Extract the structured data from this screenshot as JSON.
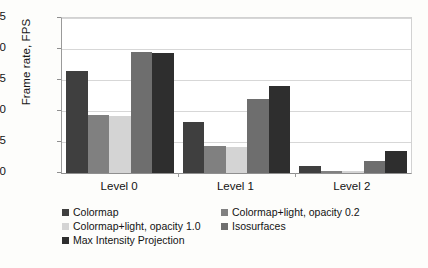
{
  "chart_data": {
    "type": "bar",
    "title": "",
    "xlabel": "",
    "ylabel": "Frame rate, FPS",
    "categories": [
      "Level 0",
      "Level 1",
      "Level 2"
    ],
    "ylim": [
      0,
      25
    ],
    "yticks": [
      0,
      5,
      10,
      15,
      20,
      25
    ],
    "grid": true,
    "legend_position": "bottom",
    "series": [
      {
        "name": "Colormap",
        "color": "#3f3f3f",
        "values": [
          16.5,
          8.3,
          1.2
        ]
      },
      {
        "name": "Colormap+light, opacity 0.2",
        "color": "#808080",
        "values": [
          9.3,
          4.3,
          0.4
        ]
      },
      {
        "name": "Colormap+light, opacity 1.0",
        "color": "#d4d4d4",
        "values": [
          9.2,
          4.2,
          0.3
        ]
      },
      {
        "name": "Isosurfaces",
        "color": "#6e6e6e",
        "values": [
          19.5,
          11.9,
          2.0
        ]
      },
      {
        "name": "Max Intensity Projection",
        "color": "#2e2e2e",
        "values": [
          19.4,
          14.0,
          3.6
        ]
      }
    ]
  },
  "axis": {
    "y_title": "Frame rate, FPS",
    "tick_labels": [
      "25",
      "20",
      "15",
      "10",
      "5",
      "0"
    ]
  },
  "legend": {
    "rows": [
      [
        {
          "label": "Colormap",
          "color": "#3f3f3f"
        },
        {
          "label": "Colormap+light, opacity 0.2",
          "color": "#808080"
        }
      ],
      [
        {
          "label": "Colormap+light, opacity 1.0",
          "color": "#d4d4d4"
        },
        {
          "label": "Isosurfaces",
          "color": "#6e6e6e"
        }
      ],
      [
        {
          "label": "Max Intensity Projection",
          "color": "#2e2e2e"
        }
      ]
    ]
  },
  "colors": {
    "background": "#fdfdfb",
    "plot_background": "#ffffff",
    "gridline": "#d7d7d7",
    "axis_line": "#8f8f8f",
    "text": "#131313"
  }
}
